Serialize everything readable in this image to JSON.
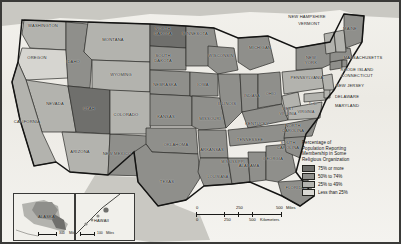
{
  "map": {
    "title": "Percentage of Population Reporting Membership in Some Religious Organization",
    "frame_color": "#3a3a38",
    "ocean_color": "#f2f1ec"
  },
  "legend": {
    "title_lines": [
      "Percentage of",
      "Population Reporting",
      "Membership in Some",
      "Religious Organization"
    ],
    "title_full": "Percentage of Population Reporting Membership in Some Religious Organization",
    "items": [
      {
        "label": "75% or more",
        "color": "#6f6f6c",
        "class": "c75"
      },
      {
        "label": "50% to 74%",
        "color": "#8f8f8b",
        "class": "c50"
      },
      {
        "label": "25% to 49%",
        "color": "#b3b3ae",
        "class": "c25"
      },
      {
        "label": "Less than 25%",
        "color": "#d9d8d3",
        "class": "c0"
      }
    ]
  },
  "scale": {
    "miles": {
      "ticks": [
        "0",
        "250",
        "500"
      ],
      "unit": "Miles"
    },
    "kilometers": {
      "ticks": [
        "0",
        "250",
        "500"
      ],
      "unit": "Kilometers"
    }
  },
  "insets": [
    {
      "name": "ALASKA",
      "scale_value": "300",
      "scale_unit": "Miles"
    },
    {
      "name": "HAWAII",
      "scale_value": "100",
      "scale_unit": "Miles"
    }
  ],
  "states": [
    {
      "name": "WASHINGTON",
      "x": 42,
      "y": 28,
      "cat": "c25"
    },
    {
      "name": "OREGON",
      "x": 36,
      "y": 58,
      "cat": "c0"
    },
    {
      "name": "IDAHO",
      "x": 73,
      "y": 62,
      "cat": "c50"
    },
    {
      "name": "MONTANA",
      "x": 112,
      "y": 40,
      "cat": "c25"
    },
    {
      "name": "WYOMING",
      "x": 121,
      "y": 75,
      "cat": "c25"
    },
    {
      "name": "NEVADA",
      "x": 55,
      "y": 104,
      "cat": "c25"
    },
    {
      "name": "UTAH",
      "x": 89,
      "y": 109,
      "cat": "c75"
    },
    {
      "name": "CALIFORNIA",
      "x": 25,
      "y": 122,
      "cat": "c25"
    },
    {
      "name": "ARIZONA",
      "x": 80,
      "y": 152,
      "cat": "c25"
    },
    {
      "name": "NEW MEXICO",
      "x": 117,
      "y": 156,
      "cat": "c50"
    },
    {
      "name": "COLORADO",
      "x": 126,
      "y": 115,
      "cat": "c25"
    },
    {
      "name": "NORTH DAKOTA",
      "x": 163,
      "y": 31,
      "cat": "c75"
    },
    {
      "name": "SOUTH DAKOTA",
      "x": 163,
      "y": 58,
      "cat": "c50"
    },
    {
      "name": "NEBRASKA",
      "x": 165,
      "y": 85,
      "cat": "c50"
    },
    {
      "name": "KANSAS",
      "x": 166,
      "y": 117,
      "cat": "c50"
    },
    {
      "name": "OKLAHOMA",
      "x": 175,
      "y": 145,
      "cat": "c50"
    },
    {
      "name": "TEXAS",
      "x": 166,
      "y": 182,
      "cat": "c50"
    },
    {
      "name": "MINNESOTA",
      "x": 194,
      "y": 34,
      "cat": "c50"
    },
    {
      "name": "IOWA",
      "x": 202,
      "y": 85,
      "cat": "c50"
    },
    {
      "name": "MISSOURI",
      "x": 209,
      "y": 119,
      "cat": "c50"
    },
    {
      "name": "ARKANSAS",
      "x": 210,
      "y": 150,
      "cat": "c50"
    },
    {
      "name": "LOUISIANA",
      "x": 216,
      "y": 177,
      "cat": "c50"
    },
    {
      "name": "WISCONSIN",
      "x": 219,
      "y": 56,
      "cat": "c50"
    },
    {
      "name": "ILLINOIS",
      "x": 226,
      "y": 104,
      "cat": "c50"
    },
    {
      "name": "MISSISSIPPI",
      "x": 231,
      "y": 162,
      "cat": "c50"
    },
    {
      "name": "ALABAMA",
      "x": 248,
      "y": 166,
      "cat": "c50"
    },
    {
      "name": "MICHIGAN",
      "x": 258,
      "y": 48,
      "cat": "c50"
    },
    {
      "name": "INDIANA",
      "x": 250,
      "y": 96,
      "cat": "c50"
    },
    {
      "name": "OHIO",
      "x": 268,
      "y": 94,
      "cat": "c50"
    },
    {
      "name": "KENTUCKY",
      "x": 256,
      "y": 124,
      "cat": "c50"
    },
    {
      "name": "TENNESSEE",
      "x": 248,
      "y": 140,
      "cat": "c50"
    },
    {
      "name": "GEORGIA",
      "x": 271,
      "y": 159,
      "cat": "c50"
    },
    {
      "name": "FLORIDA",
      "x": 293,
      "y": 188,
      "cat": "c50"
    },
    {
      "name": "SOUTH CAROLINA",
      "x": 287,
      "y": 145,
      "cat": "c50"
    },
    {
      "name": "NORTH CAROLINA",
      "x": 292,
      "y": 128,
      "cat": "c50"
    },
    {
      "name": "WEST VIRGINIA",
      "x": 288,
      "y": 110,
      "cat": "c25"
    },
    {
      "name": "VIRGINIA",
      "x": 305,
      "y": 112,
      "cat": "c25"
    },
    {
      "name": "D.C.",
      "x": 313,
      "y": 104,
      "cat": "c25"
    },
    {
      "name": "MARYLAND",
      "x": 345,
      "y": 106,
      "cat": "c25"
    },
    {
      "name": "DELAWARE",
      "x": 345,
      "y": 97,
      "cat": "c25"
    },
    {
      "name": "NEW JERSEY",
      "x": 348,
      "y": 86,
      "cat": "c25"
    },
    {
      "name": "PENNSYLVANIA",
      "x": 305,
      "y": 78,
      "cat": "c25"
    },
    {
      "name": "NEW YORK",
      "x": 310,
      "y": 60,
      "cat": "c50"
    },
    {
      "name": "CONNECTICUT",
      "x": 355,
      "y": 76,
      "cat": "c50"
    },
    {
      "name": "RHODE ISLAND",
      "x": 355,
      "y": 70,
      "cat": "c50"
    },
    {
      "name": "MASSACHUSETTS",
      "x": 356,
      "y": 58,
      "cat": "c50"
    },
    {
      "name": "VERMONT",
      "x": 309,
      "y": 24,
      "cat": "c25"
    },
    {
      "name": "NEW HAMPSHIRE",
      "x": 305,
      "y": 17,
      "cat": "c25"
    },
    {
      "name": "MAINE",
      "x": 347,
      "y": 29,
      "cat": "c50"
    }
  ]
}
